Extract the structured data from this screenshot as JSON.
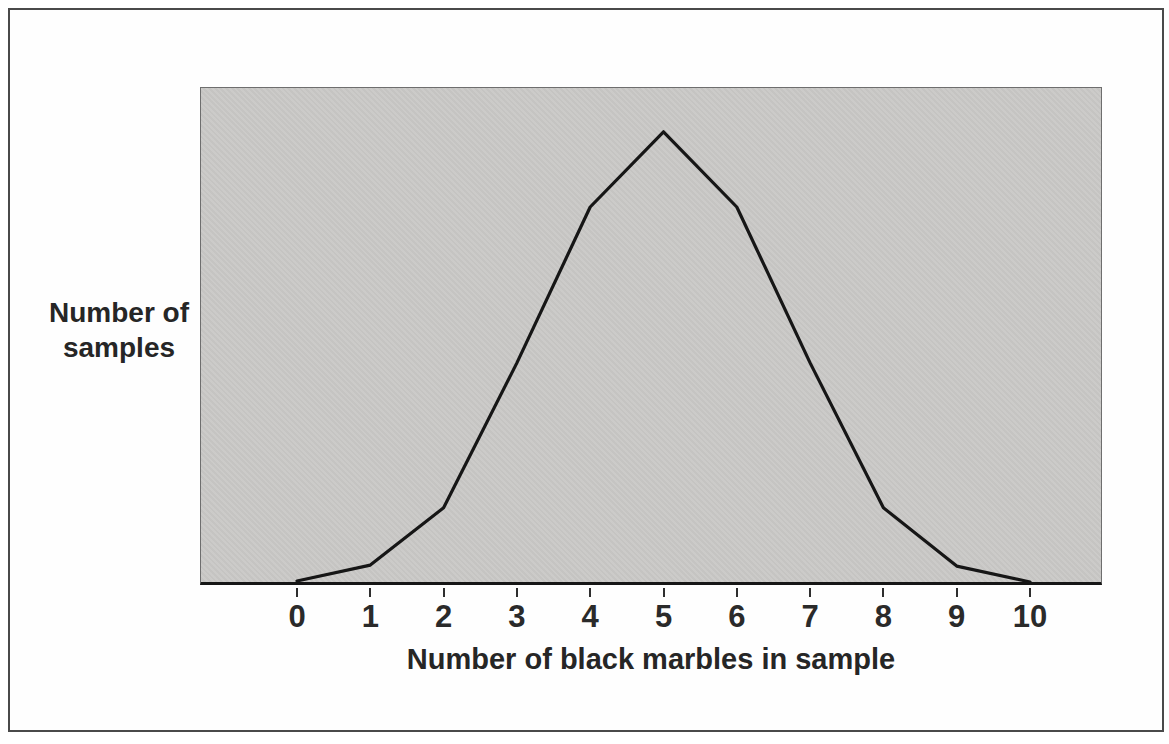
{
  "figure": {
    "frame_color": "#4a4a4a",
    "plot_background": "#c9c8c6",
    "curve_color": "#161616",
    "text_color": "#262626",
    "y_axis_label_line1": "Number of",
    "y_axis_label_line2": "samples",
    "x_axis_label": "Number of black marbles in sample"
  },
  "chart_data": {
    "type": "line",
    "title": "",
    "xlabel": "Number of black marbles in sample",
    "ylabel": "Number of samples",
    "categories": [
      "0",
      "1",
      "2",
      "3",
      "4",
      "5",
      "6",
      "7",
      "8",
      "9",
      "10"
    ],
    "x": [
      0,
      1,
      2,
      3,
      4,
      5,
      6,
      7,
      8,
      9,
      10
    ],
    "relative_heights": [
      0.008,
      0.04,
      0.155,
      0.446,
      0.759,
      0.91,
      0.759,
      0.446,
      0.155,
      0.038,
      0.006
    ],
    "y_axis_numeric_ticks": "none (axis unlabeled)",
    "grid": false,
    "legend": false,
    "peak_x": 5,
    "shape_note": "Symmetric bell-shaped (binomial-like) frequency curve peaking at 5 black marbles"
  }
}
